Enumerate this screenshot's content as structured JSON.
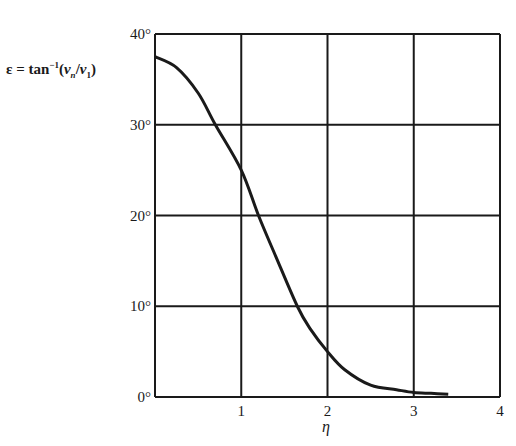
{
  "chart_data": {
    "type": "line",
    "title": "",
    "xlabel": "η",
    "ylabel": "ε = tan⁻¹(vₙ/v₁)",
    "xlim": [
      0,
      4
    ],
    "ylim": [
      0,
      40
    ],
    "x_ticks": [
      "1",
      "2",
      "3",
      "4"
    ],
    "y_ticks": [
      "0°",
      "10°",
      "20°",
      "30°",
      "40°"
    ],
    "grid": true,
    "legend": null,
    "series": [
      {
        "name": "ε",
        "x": [
          0,
          0.25,
          0.5,
          0.7,
          1.0,
          1.2,
          1.4,
          1.65,
          1.8,
          2.0,
          2.2,
          2.5,
          2.8,
          3.0,
          3.2,
          3.4
        ],
        "y": [
          37.5,
          36.3,
          33.5,
          30.0,
          25.0,
          20.0,
          15.5,
          10.0,
          7.5,
          5.0,
          3.0,
          1.3,
          0.8,
          0.5,
          0.4,
          0.3
        ]
      }
    ]
  },
  "labels": {
    "ylabel_prefix": "ε = tan",
    "ylabel_sup": "−1",
    "ylabel_open": "(",
    "ylabel_v1": "v",
    "ylabel_sub_n": "n",
    "ylabel_slash": "/",
    "ylabel_v2": "v",
    "ylabel_sub_1": "1",
    "ylabel_close": ")",
    "xlabel": "η"
  }
}
